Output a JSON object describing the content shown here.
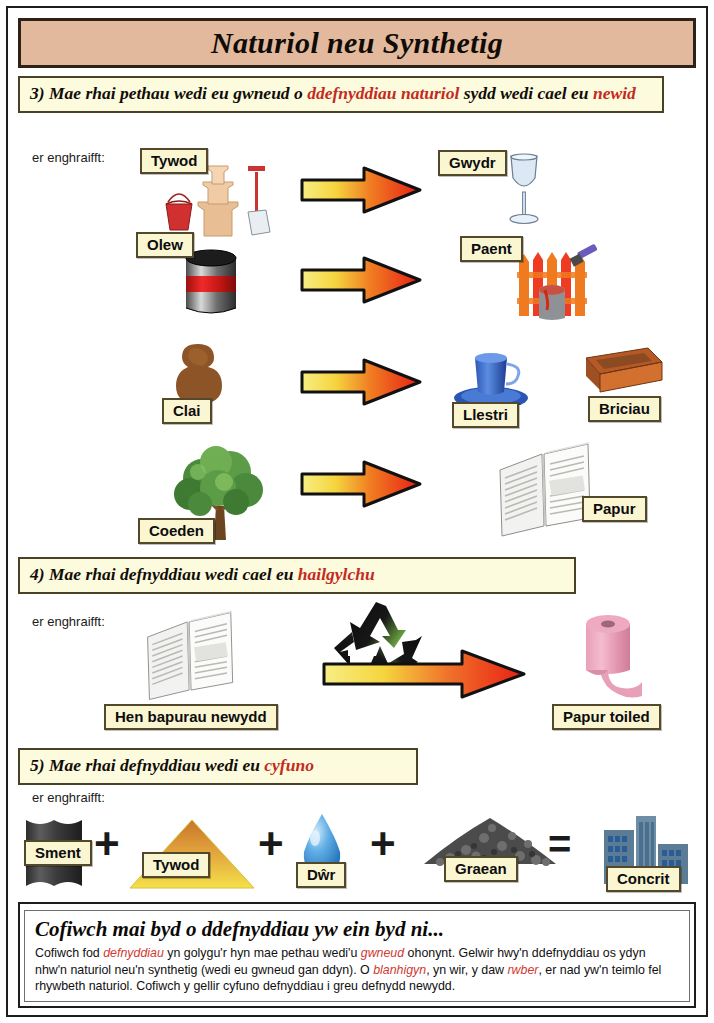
{
  "document": {
    "title": "Naturiol neu Synthetig"
  },
  "colors": {
    "title_bar": "#e2b99c",
    "banner_bg": "#fcfbde",
    "label_bg": "#faf6d2",
    "highlight_red": "#c32a21",
    "body_red": "#d03a32",
    "border_dark": "#1d1d1d"
  },
  "sections": [
    {
      "number": "3)",
      "heading_parts": [
        {
          "text": "3) Mae rhai pethau wedi eu gwneud o ",
          "style": "normal"
        },
        {
          "text": "ddefnyddiau naturiol",
          "style": "red"
        },
        {
          "text": " sydd wedi cael eu ",
          "style": "normal"
        },
        {
          "text": "newid",
          "style": "red"
        }
      ],
      "heading_plain": "3) Mae rhai pethau wedi eu gwneud o ddefnyddiau naturiol sydd wedi cael eu newid",
      "example_label": "er enghraifft:",
      "rows": [
        {
          "from": "Tywod",
          "from_icon": "sandcastle-icon",
          "to": "Gwydr",
          "to_icon": "wine-glass-icon"
        },
        {
          "from": "Olew",
          "from_icon": "oil-barrel-icon",
          "to": "Paent",
          "to_icon": "painted-fence-icon"
        },
        {
          "from": "Clai",
          "from_icon": "clay-lump-icon",
          "to": "Llestri",
          "to_icon": "cup-and-saucer-icon",
          "extra": "Briciau",
          "extra_icon": "brick-icon"
        },
        {
          "from": "Coeden",
          "from_icon": "tree-icon",
          "to": "Papur",
          "to_icon": "newspaper-icon"
        }
      ]
    },
    {
      "number": "4)",
      "heading_parts": [
        {
          "text": "4) Mae rhai defnyddiau wedi cael eu ",
          "style": "normal"
        },
        {
          "text": "hailgylchu",
          "style": "red"
        }
      ],
      "heading_plain": "4) Mae rhai defnyddiau wedi cael eu hailgylchu",
      "example_label": "er enghraifft:",
      "rows": [
        {
          "from": "Hen bapurau newydd",
          "from_icon": "newspaper-icon",
          "to": "Papur toiled",
          "to_icon": "toilet-roll-icon",
          "symbol_icon": "recycling-icon"
        }
      ]
    },
    {
      "number": "5)",
      "heading_parts": [
        {
          "text": "5) Mae rhai defnyddiau wedi eu ",
          "style": "normal"
        },
        {
          "text": "cyfuno",
          "style": "red"
        }
      ],
      "heading_plain": "5) Mae rhai defnyddiau wedi eu cyfuno",
      "example_label": "er enghraifft:",
      "equation": {
        "terms": [
          {
            "label": "Sment",
            "icon": "cement-sack-icon"
          },
          {
            "label": "Tywod",
            "icon": "sand-pile-icon"
          },
          {
            "label": "Dŵr",
            "icon": "water-drop-icon"
          },
          {
            "label": "Graean",
            "icon": "gravel-pile-icon"
          }
        ],
        "operators": [
          "+",
          "+",
          "+",
          "="
        ],
        "result": {
          "label": "Concrit",
          "icon": "buildings-icon"
        }
      }
    }
  ],
  "summary": {
    "title": "Cofiwch mai byd o ddefnyddiau yw ein byd ni...",
    "body_parts": [
      {
        "text": "Cofiwch fod ",
        "style": "normal"
      },
      {
        "text": "defnyddiau",
        "style": "red"
      },
      {
        "text": " yn golygu'r hyn mae pethau wedi'u ",
        "style": "normal"
      },
      {
        "text": "gwneud",
        "style": "red"
      },
      {
        "text": " ohonynt. Gelwir hwy'n ddefnyddiau os ydyn nhw'n naturiol neu'n synthetig (wedi eu gwneud gan ddyn). O ",
        "style": "normal"
      },
      {
        "text": "blanhigyn",
        "style": "red"
      },
      {
        "text": ", yn wir, y daw ",
        "style": "normal"
      },
      {
        "text": "rwber",
        "style": "red"
      },
      {
        "text": ", er nad yw'n teimlo fel rhywbeth naturiol. Cofiwch y gellir cyfuno defnyddiau i greu defnydd newydd.",
        "style": "normal"
      }
    ],
    "body_plain": "Cofiwch fod defnyddiau yn golygu'r hyn mae pethau wedi'u gwneud ohonynt. Gelwir hwy'n ddefnyddiau os ydyn nhw'n naturiol neu'n synthetig (wedi eu gwneud gan ddyn). O blanhigyn, yn wir, y daw rwber, er nad yw'n teimlo fel rhywbeth naturiol. Cofiwch y gellir cyfuno defnyddiau i greu defnydd newydd."
  }
}
